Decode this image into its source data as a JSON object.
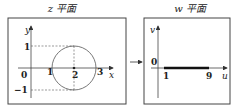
{
  "left_panel": {
    "title": "z 平面",
    "x_axis_label": "x",
    "y_axis_label": "y",
    "origin_label": "0",
    "x_ticks": [
      "1",
      "2",
      "3"
    ],
    "y_ticks": [
      "1",
      "−1"
    ],
    "shape": "circle centered at (2,0) radius 1"
  },
  "arrow": "mapping-arrow",
  "right_panel": {
    "title": "w 平面",
    "x_axis_label": "u",
    "y_axis_label": "v",
    "origin_label": "0",
    "segment_start": "1",
    "segment_end": "9"
  }
}
